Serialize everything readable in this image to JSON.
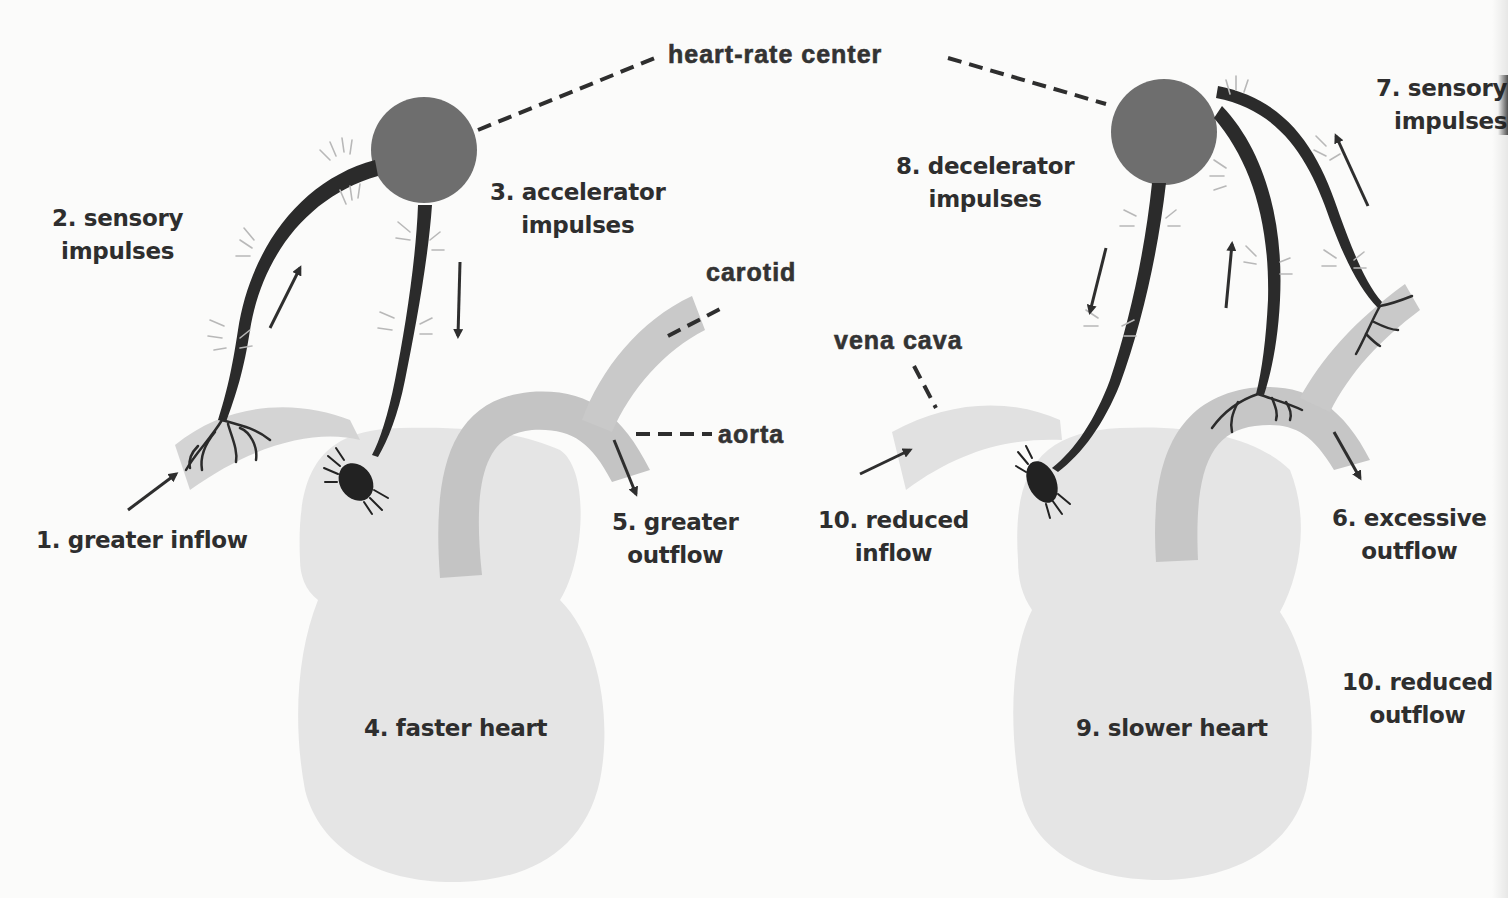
{
  "title": "heart-rate center",
  "colors": {
    "background": "#fbfbfa",
    "heart_fill": "#e4e4e4",
    "vessel_fill": "#cfcfcf",
    "aorta_fill": "#c2c2c2",
    "center_fill": "#6f6f6f",
    "nerve_fill": "#2a2a2a",
    "text": "#2e2e2e",
    "glow": "#b5b5b5"
  },
  "left_panel": {
    "labels": {
      "greater_inflow": "1. greater inflow",
      "sensory_impulses": [
        "2. sensory",
        "impulses"
      ],
      "accelerator_impulses": [
        "3. accelerator",
        "impulses"
      ],
      "faster_heart": "4. faster heart",
      "greater_outflow": [
        "5. greater",
        "outflow"
      ],
      "carotid": "carotid",
      "aorta": "aorta"
    }
  },
  "right_panel": {
    "labels": {
      "excessive_outflow": [
        "6. excessive",
        "outflow"
      ],
      "sensory_impulses": [
        "7. sensory",
        "impulses"
      ],
      "decelerator_impulses": [
        "8. decelerator",
        "impulses"
      ],
      "slower_heart": "9. slower heart",
      "reduced_inflow": [
        "10. reduced",
        "inflow"
      ],
      "reduced_outflow": [
        "10. reduced",
        "outflow"
      ],
      "vena_cava": "vena cava"
    }
  }
}
